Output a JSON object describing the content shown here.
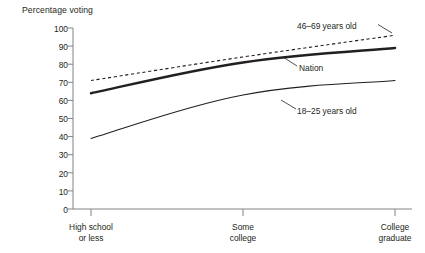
{
  "chart_data": {
    "type": "line",
    "title": "Percentage voting",
    "xlabel": "",
    "ylabel": "Percentage voting",
    "ylim": [
      0,
      100
    ],
    "ytick_step": 10,
    "yticks": [
      100,
      90,
      80,
      70,
      60,
      50,
      40,
      30,
      20,
      10,
      0
    ],
    "grid": false,
    "legend_position": "inline-annotations",
    "categories": [
      "High school or less",
      "Some college",
      "College graduate"
    ],
    "category_lines": [
      [
        "High school",
        "or less"
      ],
      [
        "Some",
        "college"
      ],
      [
        "College",
        "graduate"
      ]
    ],
    "series": [
      {
        "name": "46-69 years old",
        "label": "46–69 years old",
        "style": "dashed",
        "values": [
          71,
          84,
          96
        ]
      },
      {
        "name": "Nation",
        "label": "Nation",
        "style": "thick-solid",
        "values": [
          64,
          81,
          89
        ]
      },
      {
        "name": "18-25 years old",
        "label": "18–25 years old",
        "style": "thin-solid",
        "values": [
          39,
          63,
          71
        ]
      }
    ],
    "annotations": [
      {
        "text": "46–69 years old",
        "for": "46-69 years old"
      },
      {
        "text": "Nation",
        "for": "Nation"
      },
      {
        "text": "18–25 years old",
        "for": "18-25 years old"
      }
    ],
    "colors": {
      "ink": "#231f20",
      "axis": "#6d6e71",
      "background": "#ffffff"
    }
  },
  "axis": {
    "y_labels": [
      "100",
      "90",
      "80",
      "70",
      "60",
      "50",
      "40",
      "30",
      "20",
      "10",
      "0"
    ]
  },
  "labels": {
    "title": "Percentage voting",
    "x1_line1": "High school",
    "x1_line2": "or less",
    "x2_line1": "Some",
    "x2_line2": "college",
    "x3_line1": "College",
    "x3_line2": "graduate",
    "series_old": "46–69 years old",
    "series_nation": "Nation",
    "series_young": "18–25 years old"
  }
}
